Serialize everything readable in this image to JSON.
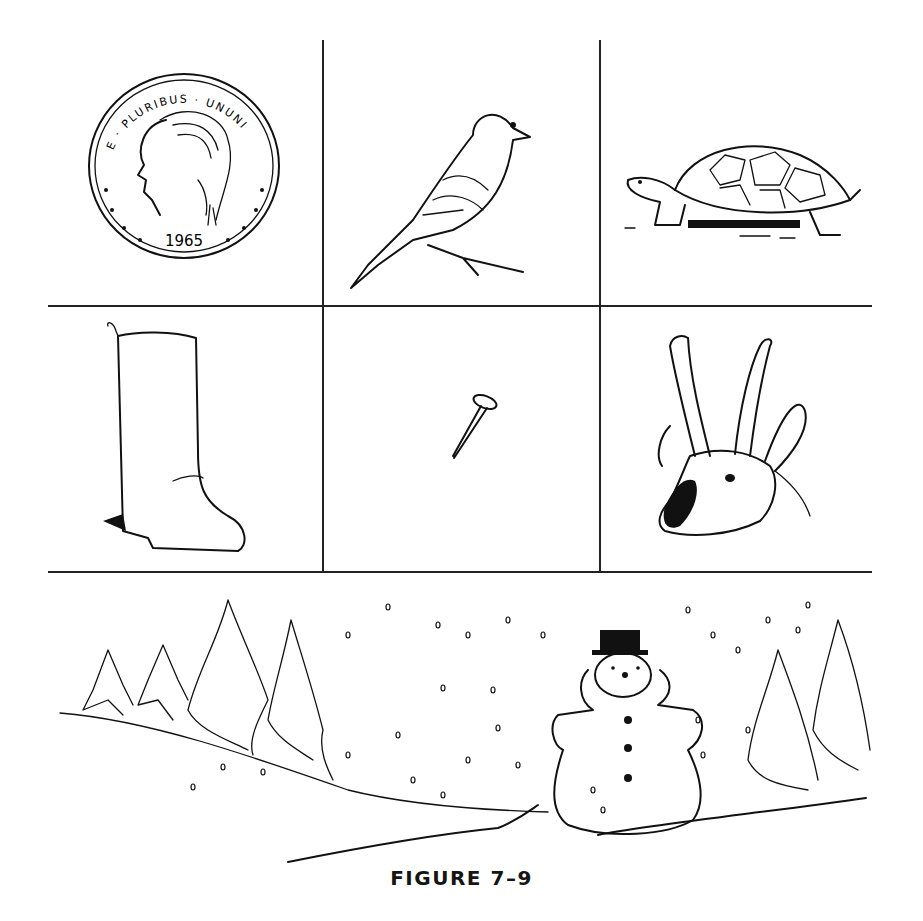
{
  "figure": {
    "caption": "FIGURE 7–9",
    "grid": {
      "rows": 2,
      "cols": 3
    },
    "cells": [
      {
        "id": "coin",
        "label": "coin",
        "text": {
          "top": "E · PLURIBUS · UNUNI",
          "year": "1965"
        }
      },
      {
        "id": "bird",
        "label": "bird"
      },
      {
        "id": "turtle",
        "label": "turtle"
      },
      {
        "id": "boot",
        "label": "boot"
      },
      {
        "id": "nail",
        "label": "nail"
      },
      {
        "id": "antelope",
        "label": "antelope"
      }
    ],
    "scene": {
      "label": "snowman in snowy landscape with pine trees"
    }
  }
}
